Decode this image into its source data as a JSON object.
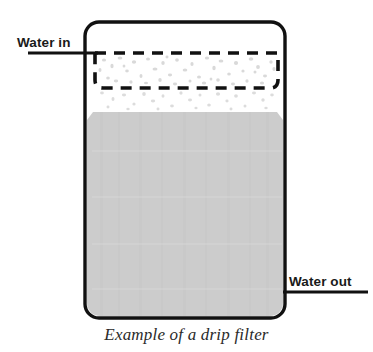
{
  "figure": {
    "caption": "Example of a drip filter",
    "labels": {
      "water_in": "Water in",
      "water_out": "Water out"
    },
    "colors": {
      "outline": "#111111",
      "water_fill": "#cccccc",
      "speckle": "#d9d9d9",
      "text": "#1a1a1a",
      "caption_text": "#2a2a2a",
      "background": "#ffffff"
    },
    "parts": {
      "vessel": "filter-vessel",
      "basket": "dashed-filter-basket",
      "water_body": "water-fill",
      "grounds": "coffee-grounds-speckles",
      "drips": "dripping-particles",
      "inlet_line": "water-in-leader-line",
      "outlet_line": "water-out-leader-line"
    },
    "geometry": {
      "vessel_x": 85,
      "vessel_y": 22,
      "vessel_width": 200,
      "vessel_height": 296,
      "vessel_corner_radius": 14,
      "basket_x": 95,
      "basket_y": 53,
      "basket_width": 183,
      "basket_height": 35,
      "water_top_y": 112,
      "inlet_line_y": 53,
      "inlet_line_x1": 28,
      "inlet_line_x2": 98,
      "outlet_line_y": 292,
      "outlet_line_x1": 283,
      "outlet_line_x2": 368
    }
  }
}
